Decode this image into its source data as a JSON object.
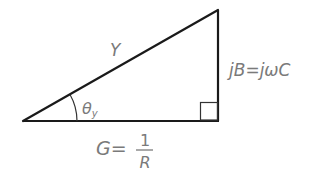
{
  "diagram": {
    "type": "right-triangle",
    "colors": {
      "line": "#1a1a1a",
      "text": "#7a7a7a",
      "background": "#ffffff"
    },
    "hypotenuse_label": "Y",
    "vertical_label": "jB=jωC",
    "angle_label": {
      "symbol": "θ",
      "subscript": "y"
    },
    "base_label": {
      "prefix": "G=",
      "numerator": "1",
      "denominator": "R"
    },
    "right_angle_marker": true
  }
}
